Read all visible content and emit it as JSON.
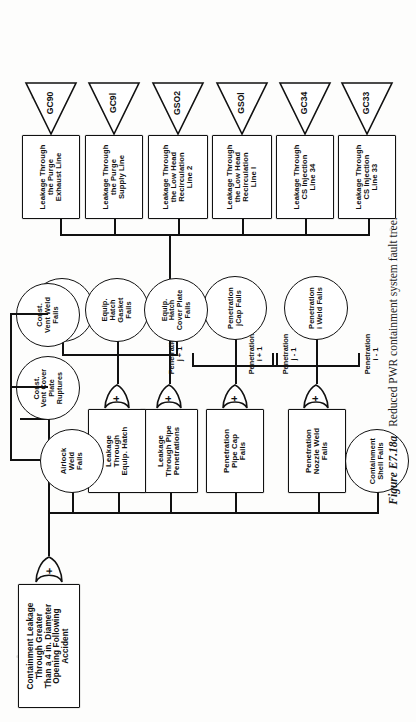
{
  "figure": {
    "number": "Figure E7.18a",
    "caption": "Reduced PWR containment system fault tree."
  },
  "diagram": {
    "type": "fault-tree",
    "top_event": {
      "id": "top",
      "shape": "rectangle",
      "label": "Containment Leakage\nThrough Greater\nThan a 4 in. Diameter\nOpening Following\nAccident"
    },
    "gates": [
      {
        "id": "gate-top",
        "type": "OR",
        "symbol": "+"
      },
      {
        "id": "gate-pipe-pen",
        "type": "OR",
        "symbol": "+"
      },
      {
        "id": "gate-equip-hatch",
        "type": "OR",
        "symbol": "+"
      },
      {
        "id": "gate-nozzle-weld",
        "type": "OR",
        "symbol": "+"
      },
      {
        "id": "gate-pipe-cap",
        "type": "OR",
        "symbol": "+"
      }
    ],
    "intermediate_events": [
      {
        "id": "pen-nozzle-weld",
        "shape": "rectangle",
        "label": "Penetration\nNozzle Weld\nFails"
      },
      {
        "id": "pen-pipe-cap",
        "shape": "rectangle",
        "label": "Penetration\nPipe Cap\nFails"
      },
      {
        "id": "leak-pipe-pen",
        "shape": "rectangle",
        "label": "Leakage\nThrough Pipe\nPenetrations"
      },
      {
        "id": "leak-equip-hatch",
        "shape": "rectangle",
        "label": "Leakage\nThrough\nEquip. Hatch"
      }
    ],
    "basic_events": [
      {
        "id": "cont-shell",
        "shape": "circle",
        "label": "Containment\nShell Fails"
      },
      {
        "id": "pen-i-weld",
        "shape": "circle",
        "label": "Penetration\ni Weld Fails"
      },
      {
        "id": "pen-j-cap",
        "shape": "circle",
        "label": "Penetration\njCap Fails"
      },
      {
        "id": "eq-weld",
        "shape": "circle",
        "label": "Equip.\nHatch\nWeld\nFails"
      },
      {
        "id": "eq-gasket",
        "shape": "circle",
        "label": "Equip.\nHatch\nGasket\nFails"
      },
      {
        "id": "eq-cover",
        "shape": "circle",
        "label": "Equip.\nHatch\nCover Plate\nFails"
      },
      {
        "id": "airlock-weld",
        "shape": "circle",
        "label": "Airlock\nWeld\nFails"
      },
      {
        "id": "cvc-plate",
        "shape": "circle",
        "label": "Const.\nVent Cover\nPlate\nRuptures"
      },
      {
        "id": "cv-weld",
        "shape": "circle",
        "label": "Const.\nVent Weld\nFails"
      }
    ],
    "annotations": [
      {
        "id": "anno-i-minus-1",
        "label": "Penetration\ni - 1"
      },
      {
        "id": "anno-i-plus-1",
        "label": "Penetration\ni + 1"
      },
      {
        "id": "anno-j-minus-1",
        "label": "Penetration\nj - 1"
      },
      {
        "id": "anno-j-plus-1",
        "label": "Penetration\nj + 1"
      }
    ],
    "transfer_branches": [
      {
        "id": "br-gc33",
        "box_label": "Leakage Through\nCS Injection\nLine 33",
        "transfer_label": "GC33"
      },
      {
        "id": "br-gc34",
        "box_label": "Leakage Through\nCS Injection\nLine 34",
        "transfer_label": "GC34"
      },
      {
        "id": "br-gso1",
        "box_label": "Leakage Through\nthe Low Head\nRecirculation\nLine l",
        "transfer_label": "GSOl"
      },
      {
        "id": "br-gso2",
        "box_label": "Leakage Through\nthe Low Head\nRecirculation\nLine 2",
        "transfer_label": "GSO2"
      },
      {
        "id": "br-gc91",
        "box_label": "Leakage Through\nthe Purge\nSupply Line",
        "transfer_label": "GC9l"
      },
      {
        "id": "br-gc90",
        "box_label": "Leakage Through\nthe Purge\nExhaust Line",
        "transfer_label": "GC90"
      }
    ],
    "colors": {
      "ink": "#111111",
      "paper": "#fdfdfc"
    }
  }
}
